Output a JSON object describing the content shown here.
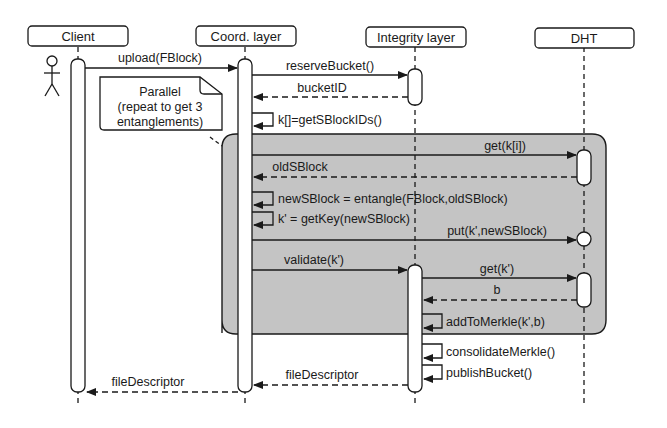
{
  "colors": {
    "ink": "#1a1a1a",
    "fragment_fill": "#c4c4c4",
    "background": "#ffffff",
    "activation_fill": "#ffffff"
  },
  "participants": [
    {
      "id": "client",
      "label": "Client",
      "actor": true
    },
    {
      "id": "coord",
      "label": "Coord. layer"
    },
    {
      "id": "integrity",
      "label": "Integrity layer"
    },
    {
      "id": "dht",
      "label": "DHT"
    }
  ],
  "note": {
    "lines": [
      "Parallel",
      "(repeat to get 3",
      "entanglements)"
    ]
  },
  "messages": [
    {
      "from": "client",
      "to": "coord",
      "label": "upload(FBlock)",
      "type": "sync"
    },
    {
      "from": "coord",
      "to": "integrity",
      "label": "reserveBucket()",
      "type": "sync"
    },
    {
      "from": "integrity",
      "to": "coord",
      "label": "bucketID",
      "type": "return"
    },
    {
      "from": "coord",
      "to": "coord",
      "label": "k[]=getSBlockIDs()",
      "type": "self"
    },
    {
      "from": "coord",
      "to": "dht",
      "label": "get(k[i])",
      "type": "sync"
    },
    {
      "from": "dht",
      "to": "coord",
      "label": "oldSBlock",
      "type": "return"
    },
    {
      "from": "coord",
      "to": "coord",
      "label": "newSBlock = entangle(FBlock,oldSBlock)",
      "type": "self"
    },
    {
      "from": "coord",
      "to": "coord",
      "label": "k' = getKey(newSBlock)",
      "type": "self"
    },
    {
      "from": "coord",
      "to": "dht",
      "label": "put(k',newSBlock)",
      "type": "sync"
    },
    {
      "from": "coord",
      "to": "integrity",
      "label": "validate(k')",
      "type": "sync"
    },
    {
      "from": "integrity",
      "to": "dht",
      "label": "get(k')",
      "type": "sync"
    },
    {
      "from": "dht",
      "to": "integrity",
      "label": "b",
      "type": "return"
    },
    {
      "from": "integrity",
      "to": "integrity",
      "label": "addToMerkle(k',b)",
      "type": "self"
    },
    {
      "from": "integrity",
      "to": "integrity",
      "label": "consolidateMerkle()",
      "type": "self"
    },
    {
      "from": "integrity",
      "to": "integrity",
      "label": "publishBucket()",
      "type": "self"
    },
    {
      "from": "integrity",
      "to": "coord",
      "label": "fileDescriptor",
      "type": "return"
    },
    {
      "from": "coord",
      "to": "client",
      "label": "fileDescriptor",
      "type": "return"
    }
  ],
  "fragment": {
    "kind": "parallel",
    "from_message": 4,
    "to_message": 12
  }
}
